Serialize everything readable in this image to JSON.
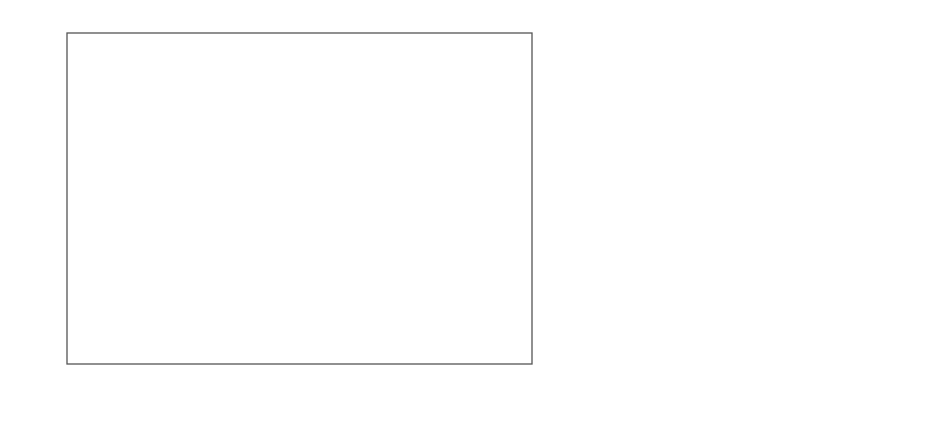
{
  "panel_a": {
    "letter": "a",
    "ylabel": "ρ, g/cm",
    "ylabel_sup": "3",
    "xlabel": "dT/dt@70°C, °C/s",
    "y_ticks": [
      "0,91",
      "0,905",
      "0,9",
      "0,895",
      "0,89",
      "0,885"
    ],
    "x_ticks": [
      "0,01",
      "0,1",
      "1",
      "10",
      "100"
    ]
  },
  "panel_b": {
    "letter": "b",
    "xlabel": "2θ",
    "x_ticks": [
      "5",
      "10",
      "15",
      "20",
      "25",
      "30",
      "35"
    ],
    "curve_labels": [
      "1000 °C/s",
      "204 °C/s",
      "137 °C/s",
      "54 °C/s",
      "25 °C/s",
      "15 °C/s",
      "5 °C/s",
      "2.15 °C/s",
      "0.14 °C/s",
      "0.072 °C/s"
    ]
  },
  "colors": {
    "axis": "#555555",
    "marker": "#444444",
    "curve": "#555555"
  },
  "chart_data": [
    {
      "type": "scatter",
      "title": "",
      "xlabel": "dT/dt@70°C, °C/s",
      "ylabel": "ρ, g/cm³",
      "xscale": "log",
      "xlim": [
        0.01,
        1000
      ],
      "ylim": [
        0.885,
        0.91
      ],
      "grid": false,
      "series": [
        {
          "name": "open diamonds",
          "marker": "open-diamond",
          "points": [
            [
              0.074,
              0.908
            ],
            [
              0.144,
              0.9068
            ],
            [
              0.35,
              0.9068
            ],
            [
              0.34,
              0.9046
            ],
            [
              0.73,
              0.9038
            ],
            [
              1.26,
              0.9052
            ],
            [
              2.24,
              0.9032
            ],
            [
              5.2,
              0.9021
            ],
            [
              11.4,
              0.9009
            ],
            [
              25.9,
              0.9006
            ],
            [
              29.2,
              0.9
            ],
            [
              36.6,
              0.9001
            ],
            [
              44.6,
              0.8993
            ],
            [
              56,
              0.8987
            ],
            [
              72,
              0.8959
            ],
            [
              102,
              0.8927
            ],
            [
              107,
              0.8898
            ],
            [
              99,
              0.8893
            ],
            [
              116,
              0.888
            ],
            [
              190,
              0.8883
            ],
            [
              400,
              0.8873
            ],
            [
              600,
              0.8876
            ],
            [
              1040,
              0.8876
            ],
            [
              1040,
              0.8871
            ]
          ]
        },
        {
          "name": "filled diamonds",
          "marker": "filled-diamond",
          "points": [
            [
              0.17,
              0.9078
            ],
            [
              0.256,
              0.9069
            ],
            [
              0.345,
              0.9065
            ],
            [
              0.87,
              0.9036
            ],
            [
              1.75,
              0.9039
            ],
            [
              2.68,
              0.9036
            ]
          ]
        }
      ]
    },
    {
      "type": "line",
      "title": "",
      "xlabel": "2θ",
      "ylabel": "",
      "xlim": [
        5,
        35
      ],
      "grid": false,
      "x_ticks": [
        5,
        10,
        15,
        20,
        25,
        30,
        35
      ],
      "note": "stacked WAXD diffractograms, offset vertically; peaks near 2θ≈14, 17, 18.5, 21, 22",
      "series": [
        {
          "name": "1000 °C/s",
          "type": "mesophase",
          "baseline_px": 87
        },
        {
          "name": "204 °C/s",
          "type": "mixed",
          "baseline_px": 110
        },
        {
          "name": "137 °C/s",
          "type": "crystalline",
          "baseline_px": 135
        },
        {
          "name": "54 °C/s",
          "type": "crystalline",
          "baseline_px": 164
        },
        {
          "name": "25 °C/s",
          "type": "crystalline",
          "baseline_px": 198
        },
        {
          "name": "15 °C/s",
          "type": "crystalline",
          "baseline_px": 220
        },
        {
          "name": "5 °C/s",
          "type": "crystalline",
          "baseline_px": 242
        },
        {
          "name": "2.15 °C/s",
          "type": "crystalline",
          "baseline_px": 262
        },
        {
          "name": "0.14 °C/s",
          "type": "crystalline",
          "baseline_px": 285
        },
        {
          "name": "0.072 °C/s",
          "type": "crystalline",
          "baseline_px": 306
        }
      ]
    }
  ]
}
